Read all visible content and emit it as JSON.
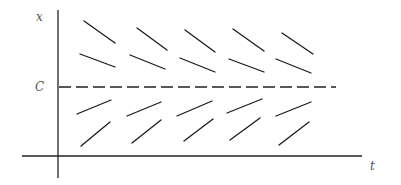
{
  "diagram": {
    "labels": {
      "y_axis": "x",
      "x_axis": "t",
      "equilibrium": "C"
    },
    "axes": {
      "vertical": {
        "x": 58,
        "y1": 10,
        "y2": 178
      },
      "horizontal": {
        "y": 156,
        "x1": 22,
        "x2": 362
      }
    },
    "equilibrium_line": {
      "y": 87,
      "x1": 59,
      "x2": 336,
      "style": "dashed"
    },
    "segments": [
      {
        "row": 1,
        "x1": 84,
        "y1": 21,
        "x2": 115,
        "y2": 43
      },
      {
        "row": 1,
        "x1": 137,
        "y1": 28,
        "x2": 167,
        "y2": 50
      },
      {
        "row": 1,
        "x1": 185,
        "y1": 30,
        "x2": 215,
        "y2": 52
      },
      {
        "row": 1,
        "x1": 233,
        "y1": 29,
        "x2": 264,
        "y2": 51
      },
      {
        "row": 1,
        "x1": 282,
        "y1": 33,
        "x2": 313,
        "y2": 54
      },
      {
        "row": 2,
        "x1": 80,
        "y1": 54,
        "x2": 115,
        "y2": 67
      },
      {
        "row": 2,
        "x1": 130,
        "y1": 55,
        "x2": 165,
        "y2": 69
      },
      {
        "row": 2,
        "x1": 180,
        "y1": 58,
        "x2": 215,
        "y2": 72
      },
      {
        "row": 2,
        "x1": 229,
        "y1": 59,
        "x2": 264,
        "y2": 72
      },
      {
        "row": 2,
        "x1": 276,
        "y1": 59,
        "x2": 311,
        "y2": 73
      },
      {
        "row": 3,
        "x1": 77,
        "y1": 114,
        "x2": 111,
        "y2": 100
      },
      {
        "row": 3,
        "x1": 127,
        "y1": 116,
        "x2": 161,
        "y2": 102
      },
      {
        "row": 3,
        "x1": 177,
        "y1": 116,
        "x2": 212,
        "y2": 101
      },
      {
        "row": 3,
        "x1": 227,
        "y1": 113,
        "x2": 262,
        "y2": 99
      },
      {
        "row": 3,
        "x1": 276,
        "y1": 116,
        "x2": 311,
        "y2": 102
      },
      {
        "row": 4,
        "x1": 81,
        "y1": 146,
        "x2": 110,
        "y2": 122
      },
      {
        "row": 4,
        "x1": 132,
        "y1": 143,
        "x2": 161,
        "y2": 120
      },
      {
        "row": 4,
        "x1": 184,
        "y1": 141,
        "x2": 213,
        "y2": 119
      },
      {
        "row": 4,
        "x1": 230,
        "y1": 140,
        "x2": 260,
        "y2": 118
      },
      {
        "row": 4,
        "x1": 279,
        "y1": 145,
        "x2": 309,
        "y2": 122
      }
    ],
    "colors": {
      "line": "#1a1a1a",
      "label": "#555555",
      "background": "#ffffff"
    }
  }
}
